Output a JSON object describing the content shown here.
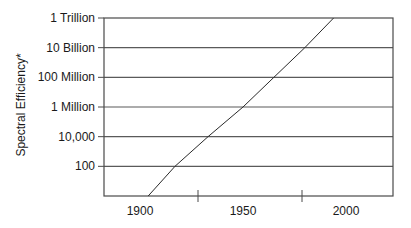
{
  "chart_data": {
    "type": "line",
    "title": "",
    "xlabel": "",
    "ylabel": "Spectral Efficiency*",
    "y_scale": "log",
    "y_tick_labels": [
      "100",
      "10,000",
      "1 Million",
      "100 Million",
      "10 Billion",
      "1 Trillion"
    ],
    "y_tick_values": [
      100,
      10000,
      1000000,
      100000000,
      10000000000,
      1000000000000
    ],
    "x_tick_labels": [
      "1900",
      "1950",
      "2000"
    ],
    "x_range": [
      1875,
      2025
    ],
    "ylim": [
      1,
      1000000000000
    ],
    "grid": {
      "horizontal": true,
      "vertical": false
    },
    "legend": null,
    "series": [
      {
        "name": "Spectral Efficiency",
        "points": [
          {
            "x": 1904,
            "y": 1
          },
          {
            "x": 1917,
            "y": 100
          },
          {
            "x": 1933,
            "y": 10000
          },
          {
            "x": 1950,
            "y": 1000000
          },
          {
            "x": 1965,
            "y": 100000000
          },
          {
            "x": 1980,
            "y": 10000000000
          },
          {
            "x": 1994,
            "y": 1000000000000
          }
        ]
      }
    ]
  },
  "colors": {
    "frame": "#4a4a4a",
    "grid": "#5a5a5a",
    "line": "#2a2a2a",
    "text": "#1a1a1a"
  }
}
